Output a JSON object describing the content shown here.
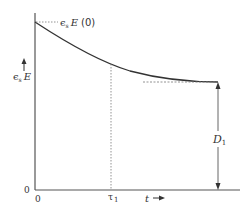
{
  "diagram": {
    "y_axis_label": {
      "symbol": "ϵ",
      "subscript": "s",
      "var": "E"
    },
    "initial_label": {
      "symbol": "ϵ",
      "subscript": "s",
      "var": "E",
      "arg": "(0)"
    },
    "x_axis_label": "t",
    "y_origin_label": "0",
    "x_origin_label": "0",
    "tau_label": {
      "symbol": "τ",
      "subscript": "1"
    },
    "distance_label": {
      "var": "D",
      "subscript": "1"
    },
    "colors": {
      "axis": "#555555",
      "curve": "#333333",
      "dotted": "#777777",
      "text": "#333333"
    }
  }
}
